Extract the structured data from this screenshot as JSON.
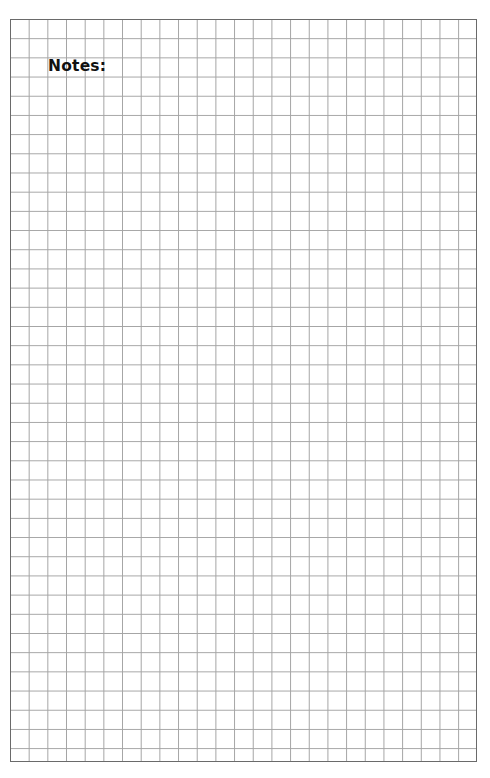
{
  "page": {
    "type": "graph-paper-notes-page",
    "notes_label": "Notes:",
    "grid": {
      "columns": 25,
      "rows": 39,
      "line_color": "#a4a4a4",
      "border_color": "#6a6a6a",
      "background_color": "#ffffff"
    }
  }
}
